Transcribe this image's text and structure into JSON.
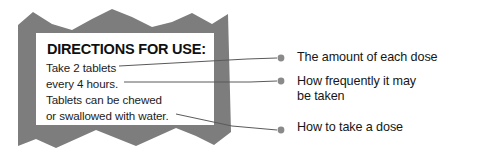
{
  "figure": {
    "type": "annotated-diagram",
    "colors": {
      "torn_border_gray": "#7d7d7d",
      "panel_white": "#ffffff",
      "text_black": "#111111",
      "leader_line_gray": "#555555",
      "bullet_gray": "#8a8a8a",
      "background": "#ffffff"
    }
  },
  "label": {
    "heading": "DIRECTIONS FOR USE:",
    "body_lines": [
      "Take 2 tablets",
      "every 4 hours.",
      "Tablets can be chewed",
      "or swallowed with water."
    ]
  },
  "annotations": [
    {
      "id": "dose-amount",
      "text": "The amount of each dose",
      "bullet": "leader-dot",
      "refers_to_line": "Take 2 tablets"
    },
    {
      "id": "dose-frequency",
      "text": "How frequently it may\nbe taken",
      "bullet": "leader-dot",
      "refers_to_line": "every 4 hours."
    },
    {
      "id": "dose-method",
      "text": "How to take a dose",
      "bullet": "leader-dot",
      "refers_to_line": "or swallowed with water."
    }
  ]
}
